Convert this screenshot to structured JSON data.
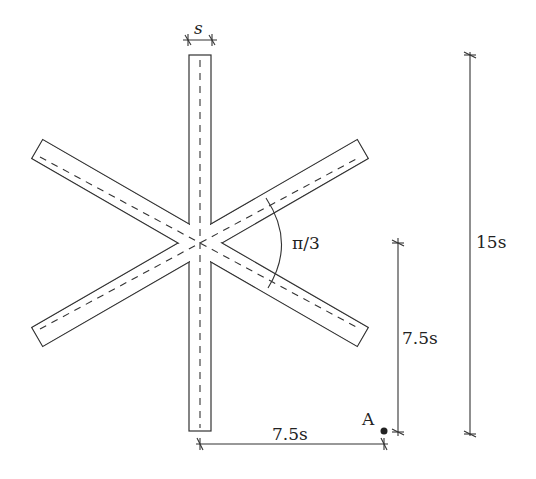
{
  "figure": {
    "colors": {
      "stroke": "#333333",
      "background": "#ffffff"
    }
  },
  "labels": {
    "width_label": "s",
    "angle_label": "π/3",
    "height_total_label": "15s",
    "height_half_label": "7.5s",
    "horizontal_offset_label": "7.5s",
    "point_label": "A"
  },
  "dimensions": {
    "bar_width": "s",
    "bar_length": "15s",
    "angle_between_arms": "π/3",
    "point_A_vertical_offset": "7.5s",
    "point_A_horizontal_offset": "7.5s"
  }
}
